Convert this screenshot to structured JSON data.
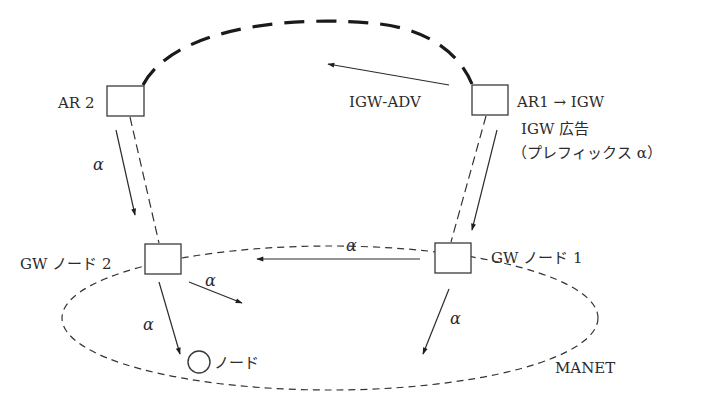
{
  "diagram": {
    "type": "network-topology",
    "nodes": {
      "ar2": {
        "label": "AR 2"
      },
      "ar1": {
        "label": "AR1 → IGW"
      },
      "gw2": {
        "label": "GW ノード 2"
      },
      "gw1": {
        "label": "GW ノード 1"
      },
      "node": {
        "label": "ノード"
      }
    },
    "annotations": {
      "igw_adv": "IGW‐ADV",
      "igw_ad_line1": "IGW 広告",
      "igw_ad_line2": "（プレフィックス α）",
      "manet": "MANET"
    },
    "edge_labels": {
      "ar2_to_gw2": "α",
      "gw1_to_gw2": "α",
      "gw2_right": "α",
      "gw2_to_node": "α",
      "gw1_down": "α"
    },
    "edges": [
      {
        "from": "ar2",
        "to": "ar1",
        "style": "thick-dashed-arc"
      },
      {
        "from": "ar1",
        "to": "left",
        "style": "arrow",
        "label": "IGW-ADV"
      },
      {
        "from": "ar2",
        "to": "gw2",
        "style": "arrow",
        "label": "α"
      },
      {
        "from": "ar2",
        "to": "gw2",
        "style": "thin-dashed"
      },
      {
        "from": "ar1",
        "to": "gw1",
        "style": "arrow"
      },
      {
        "from": "ar1",
        "to": "gw1",
        "style": "thin-dashed"
      },
      {
        "from": "gw1",
        "to": "gw2",
        "style": "arrow",
        "label": "α"
      },
      {
        "from": "gw2",
        "to": "right",
        "style": "arrow",
        "label": "α"
      },
      {
        "from": "gw2",
        "to": "node",
        "style": "arrow",
        "label": "α"
      },
      {
        "from": "gw1",
        "to": "down-left",
        "style": "arrow",
        "label": "α"
      }
    ]
  }
}
